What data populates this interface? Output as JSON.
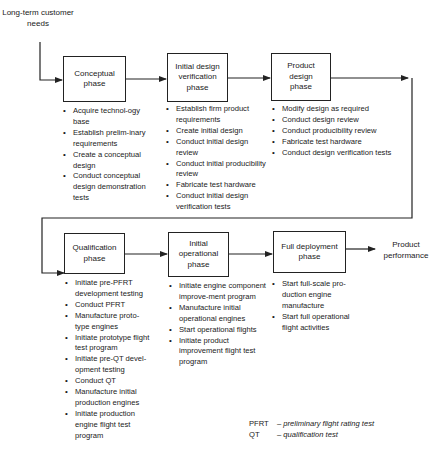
{
  "input_label": "Long-term customer needs",
  "output_label": "Product performance",
  "phases": [
    {
      "title": "Conceptual phase",
      "activities": [
        "Acquire technol-ogy base",
        "Establish prelim-inary requirements",
        "Create a conceptual design",
        "Conduct conceptual design demonstration tests"
      ]
    },
    {
      "title": "Initial design verification phase",
      "activities": [
        "Establish firm product requirements",
        "Create initial design",
        "Conduct initial design review",
        "Conduct initial producibility review",
        "Fabricate test hardware",
        "Conduct initial design verification tests"
      ]
    },
    {
      "title": "Product design phase",
      "activities": [
        "Modify design as required",
        "Conduct design review",
        "Conduct producibility review",
        "Fabricate test hardware",
        "Conduct design verification tests"
      ]
    },
    {
      "title": "Qualification phase",
      "activities": [
        "Initiate pre-PFRT development testing",
        "Conduct PFRT",
        "Manufacture proto-type engines",
        "Initiate prototype flight test program",
        "Initiate pre-QT devel-opment testing",
        "Conduct QT",
        "Manufacture initial production engines",
        "Initiate production engine flight test program"
      ]
    },
    {
      "title": "Initial operational phase",
      "activities": [
        "Initiate engine component improve-ment program",
        "Manufacture initial operational engines",
        "Start operational flights",
        "Initiate product improvement flight test program"
      ]
    },
    {
      "title": "Full deployment phase",
      "activities": [
        "Start full-scale pro-duction engine manufacture",
        "Start full operational flight activities"
      ]
    }
  ],
  "legend": [
    {
      "abbr": "PFRT",
      "definition": "– preliminary flight rating test"
    },
    {
      "abbr": "QT",
      "definition": "– qualification test"
    }
  ]
}
